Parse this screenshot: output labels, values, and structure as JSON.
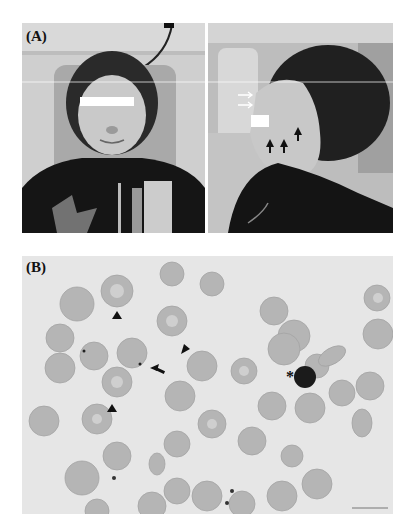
{
  "figure": {
    "panel_a": {
      "label": "(A)",
      "description": "Patient photographs: frontal and lateral views, seated in clinic chair, eyes obscured by white bars",
      "left_photo": {
        "view": "frontal"
      },
      "right_photo": {
        "view": "lateral",
        "annotations": [
          "white arrows near temple",
          "black arrows along jaw/cheek"
        ]
      }
    },
    "panel_b": {
      "label": "(B)",
      "description": "Peripheral blood smear micrograph of red blood cells",
      "markers": {
        "arrowheads": 3,
        "arrow": 1,
        "asterisk": "*"
      },
      "scale_bar_label": "10μm"
    },
    "colors": {
      "background": "#ffffff",
      "smear_bg": "#e6e6e6",
      "cell": "#b5b5b5",
      "cell_center": "#cfcfcf",
      "dark": "#111111"
    }
  }
}
